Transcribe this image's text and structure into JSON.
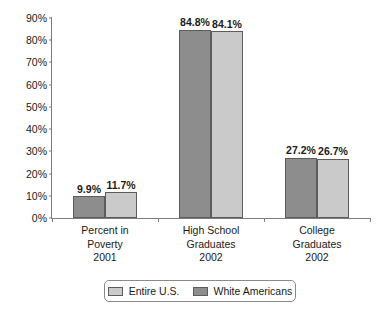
{
  "chart_data": {
    "type": "bar",
    "title": "",
    "subtitle": "",
    "xlabel": "",
    "ylabel": "",
    "ylim": [
      0,
      90
    ],
    "ytick_labels": [
      "0%",
      "10%",
      "20%",
      "30%",
      "40%",
      "50%",
      "60%",
      "70%",
      "80%",
      "90%"
    ],
    "ytick_values": [
      0,
      10,
      20,
      30,
      40,
      50,
      60,
      70,
      80,
      90
    ],
    "grid": false,
    "legend_position": "bottom",
    "value_label_suffix": "%",
    "categories": [
      {
        "line1": "Percent in",
        "line2": "Poverty",
        "line3": "2001"
      },
      {
        "line1": "High School",
        "line2": "Graduates",
        "line3": "2002"
      },
      {
        "line1": "College",
        "line2": "Graduates",
        "line3": "2002"
      }
    ],
    "series": [
      {
        "name": "White Americans",
        "color": "#8d8d8d",
        "values": [
          9.9,
          84.8,
          27.2
        ],
        "value_labels": [
          "9.9%",
          "84.8%",
          "27.2%"
        ]
      },
      {
        "name": "Entire U.S.",
        "color": "#cacaca",
        "values": [
          11.7,
          84.1,
          26.7
        ],
        "value_labels": [
          "11.7%",
          "84.1%",
          "26.7%"
        ]
      }
    ],
    "legend_entries": [
      {
        "label": "Entire U.S.",
        "color": "#cacaca",
        "series_index": 1
      },
      {
        "label": "White Americans",
        "color": "#8d8d8d",
        "series_index": 0
      }
    ]
  },
  "colors": {
    "axis": "#7d7d7d",
    "bar_border": "#5c5c5c",
    "text": "#1a1a1a",
    "background": "#ffffff",
    "dark_gray": "#8d8d8d",
    "light_gray": "#cacaca"
  }
}
